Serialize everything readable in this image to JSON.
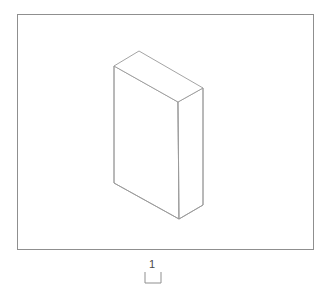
{
  "canvas": {
    "width": 332,
    "height": 284,
    "background_color": "#ffffff"
  },
  "drawing": {
    "title": "isometric-box-drawing",
    "type": "technical-line-drawing",
    "projection": "isometric",
    "line_color": "#9a9a9a",
    "frame_color": "#8f8f8f",
    "fill_color": "#ffffff"
  },
  "frame": {
    "name": "viewport-border",
    "x": 17,
    "y": 14,
    "width": 296,
    "height": 235
  },
  "solid": {
    "name": "rectangular-slab",
    "description": "thin rectangular box shown in isometric projection",
    "vertices": {
      "top_back_left": [
        114,
        66
      ],
      "top_back_apex": [
        139,
        51
      ],
      "top_right": [
        203,
        88
      ],
      "top_front_center": [
        178,
        102
      ],
      "bottom_left": [
        114,
        183
      ],
      "bottom_front_center": [
        179,
        219
      ],
      "bottom_right": [
        203,
        205
      ]
    },
    "faces": {
      "top_face_points": "114,66 139,51 203,88 178,102",
      "front_face_points": "114,66 178,102 179,219 114,183",
      "right_face_points": "178,102 203,88 203,205 179,219"
    }
  },
  "scale_marker": {
    "name": "scale-reference",
    "label": "1",
    "label_x": 152,
    "label_y": 268,
    "bracket_path": "M 145 272 L 145 283 L 161 283 L 161 272",
    "unit_count": 1
  }
}
